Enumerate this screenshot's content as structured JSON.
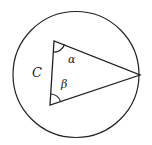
{
  "diagram": {
    "type": "geometry",
    "circle": {
      "cx": 76,
      "cy": 74.5,
      "r": 63,
      "stroke": "#222222"
    },
    "triangle": {
      "vertices": {
        "top": [
          54,
          41
        ],
        "bottom": [
          50,
          105
        ],
        "right": [
          140,
          75
        ]
      },
      "stroke": "#222222"
    },
    "labels": {
      "side": "C",
      "angle_top": "α",
      "angle_bottom": "β"
    }
  }
}
